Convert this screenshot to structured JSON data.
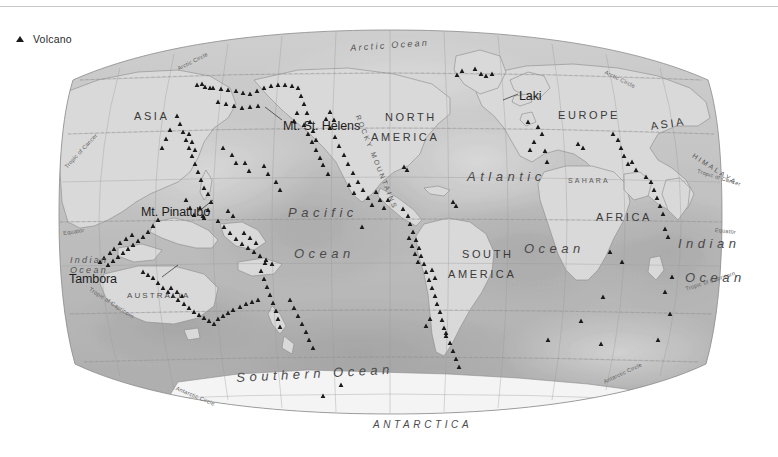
{
  "legend": {
    "icon": "volcano-triangle-icon",
    "label": "Volcano",
    "marker_color": "#1a1a1a"
  },
  "map": {
    "projection": "robinson",
    "title": "",
    "oceans": [
      {
        "name": "arctic-ocean",
        "text": "Arctic Ocean",
        "x": 292,
        "y": 22,
        "rot": -4,
        "style": "ocean-sm"
      },
      {
        "name": "pacific-ocean-1",
        "text": "Pacific",
        "x": 230,
        "y": 184,
        "rot": 0,
        "style": "ocean"
      },
      {
        "name": "pacific-ocean-2",
        "text": "Ocean",
        "x": 236,
        "y": 225,
        "rot": 0,
        "style": "ocean"
      },
      {
        "name": "atlantic-ocean-1",
        "text": "Atlantic",
        "x": 409,
        "y": 148,
        "rot": 0,
        "style": "ocean"
      },
      {
        "name": "atlantic-ocean-2",
        "text": "Ocean",
        "x": 466,
        "y": 220,
        "rot": 0,
        "style": "ocean"
      },
      {
        "name": "indian-ocean-right-1",
        "text": "Indian",
        "x": 620,
        "y": 215,
        "rot": 0,
        "style": "ocean"
      },
      {
        "name": "indian-ocean-right-2",
        "text": "Ocean",
        "x": 627,
        "y": 249,
        "rot": 0,
        "style": "ocean"
      },
      {
        "name": "indian-ocean-left",
        "text": "Indian",
        "x": 12,
        "y": 234,
        "rot": 0,
        "style": "ocean-sm"
      },
      {
        "name": "indian-ocean-left-2",
        "text": "Ocean",
        "x": 12,
        "y": 244,
        "rot": 0,
        "style": "ocean-sm"
      },
      {
        "name": "southern-ocean",
        "text": "Southern Ocean",
        "x": 178,
        "y": 349,
        "rot": -3,
        "style": "ocean"
      }
    ],
    "continents": [
      {
        "name": "asia-left",
        "text": "ASIA",
        "x": 76,
        "y": 89,
        "rot": 0,
        "style": "continent"
      },
      {
        "name": "asia-right",
        "text": "ASIA",
        "x": 592,
        "y": 99,
        "rot": -8,
        "style": "continent"
      },
      {
        "name": "north-america-1",
        "text": "NORTH",
        "x": 327,
        "y": 90,
        "rot": 0,
        "style": "continent"
      },
      {
        "name": "north-america-2",
        "text": "AMERICA",
        "x": 313,
        "y": 110,
        "rot": 0,
        "style": "continent"
      },
      {
        "name": "south-america-1",
        "text": "SOUTH",
        "x": 404,
        "y": 227,
        "rot": 0,
        "style": "continent"
      },
      {
        "name": "south-america-2",
        "text": "AMERICA",
        "x": 390,
        "y": 247,
        "rot": 0,
        "style": "continent"
      },
      {
        "name": "europe",
        "text": "EUROPE",
        "x": 500,
        "y": 88,
        "rot": 0,
        "style": "continent"
      },
      {
        "name": "africa",
        "text": "AFRICA",
        "x": 538,
        "y": 190,
        "rot": 0,
        "style": "continent"
      },
      {
        "name": "australia",
        "text": "AUSTRALIA",
        "x": 69,
        "y": 270,
        "rot": 0,
        "style": "continent-sm"
      },
      {
        "name": "antarctica",
        "text": "ANTARCTICA",
        "x": 315,
        "y": 398,
        "rot": 0,
        "style": "antarctica"
      }
    ],
    "regions": [
      {
        "name": "sahara",
        "text": "SAHARA",
        "x": 510,
        "y": 155,
        "rot": 0,
        "style": "region"
      },
      {
        "name": "himalaya",
        "text": "HIMALAYA",
        "x": 637,
        "y": 130,
        "rot": 33,
        "style": "region"
      },
      {
        "name": "rocky-mountains",
        "text": "ROCKY MOUNTAINS",
        "x": 303,
        "y": 92,
        "rot": 68,
        "style": "region"
      }
    ],
    "latitude_lines": [
      {
        "name": "arctic-circle-left",
        "text": "Arctic Circle",
        "x": 119,
        "y": 45,
        "rot": -27
      },
      {
        "name": "arctic-circle-right",
        "text": "Arctic Circle",
        "x": 548,
        "y": 48,
        "rot": 26
      },
      {
        "name": "tropic-of-cancer-left",
        "text": "Tropic of Cancer",
        "x": 6,
        "y": 144,
        "rot": -47
      },
      {
        "name": "tropic-of-cancer-right",
        "text": "Tropic of Cancer",
        "x": 640,
        "y": 147,
        "rot": 17
      },
      {
        "name": "equator-left",
        "text": "Equator",
        "x": 5,
        "y": 209,
        "rot": -8
      },
      {
        "name": "equator-right",
        "text": "Equator",
        "x": 657,
        "y": 206,
        "rot": 5
      },
      {
        "name": "tropic-of-capricorn-left",
        "text": "Tropic of Capricorn",
        "x": 33,
        "y": 265,
        "rot": 33
      },
      {
        "name": "tropic-of-capricorn-right",
        "text": "Tropic of Capricorn",
        "x": 627,
        "y": 265,
        "rot": -18
      },
      {
        "name": "antarctic-circle-left",
        "text": "Antarctic Circle",
        "x": 119,
        "y": 364,
        "rot": 23
      },
      {
        "name": "antarctic-circle-right",
        "text": "Antarctic Circle",
        "x": 545,
        "y": 358,
        "rot": -25
      }
    ],
    "volcano_labels": [
      {
        "name": "mt-st-helens",
        "text": "Mt. St. Helens",
        "x": 225,
        "y": 98,
        "leader": [
          224,
          98,
          207,
          85
        ]
      },
      {
        "name": "laki",
        "text": "Laki",
        "x": 461,
        "y": 68,
        "leader": [
          460,
          72,
          445,
          78
        ]
      },
      {
        "name": "mt-pinatubo",
        "text": "Mt. Pinatubo",
        "x": 83,
        "y": 184,
        "leader": [
          140,
          190,
          155,
          178
        ]
      },
      {
        "name": "tambora",
        "text": "Tambora",
        "x": 11,
        "y": 251,
        "leader": [
          104,
          255,
          120,
          243
        ]
      }
    ],
    "volcano_points": [
      [
        139,
        63
      ],
      [
        147,
        65
      ],
      [
        155,
        66
      ],
      [
        163,
        67
      ],
      [
        170,
        68
      ],
      [
        178,
        69
      ],
      [
        185,
        71
      ],
      [
        192,
        72
      ],
      [
        199,
        69
      ],
      [
        206,
        66
      ],
      [
        213,
        64
      ],
      [
        220,
        63
      ],
      [
        227,
        63
      ],
      [
        234,
        64
      ],
      [
        240,
        66
      ],
      [
        160,
        80
      ],
      [
        168,
        82
      ],
      [
        176,
        84
      ],
      [
        184,
        86
      ],
      [
        192,
        85
      ],
      [
        200,
        84
      ],
      [
        243,
        74
      ],
      [
        246,
        82
      ],
      [
        249,
        91
      ],
      [
        252,
        100
      ],
      [
        255,
        109
      ],
      [
        258,
        118
      ],
      [
        246,
        103
      ],
      [
        250,
        112
      ],
      [
        254,
        120
      ],
      [
        258,
        128
      ],
      [
        262,
        136
      ],
      [
        239,
        91
      ],
      [
        236,
        99
      ],
      [
        268,
        97
      ],
      [
        272,
        106
      ],
      [
        277,
        115
      ],
      [
        281,
        124
      ],
      [
        286,
        133
      ],
      [
        290,
        142
      ],
      [
        295,
        151
      ],
      [
        300,
        160
      ],
      [
        305,
        168
      ],
      [
        310,
        176
      ],
      [
        314,
        183
      ],
      [
        318,
        170
      ],
      [
        322,
        178
      ],
      [
        326,
        186
      ],
      [
        330,
        178
      ],
      [
        291,
        163
      ],
      [
        296,
        171
      ],
      [
        265,
        143
      ],
      [
        270,
        152
      ],
      [
        345,
        187
      ],
      [
        350,
        194
      ],
      [
        352,
        202
      ],
      [
        355,
        210
      ],
      [
        358,
        218
      ],
      [
        361,
        226
      ],
      [
        351,
        216
      ],
      [
        354,
        224
      ],
      [
        357,
        232
      ],
      [
        360,
        240
      ],
      [
        363,
        234
      ],
      [
        366,
        242
      ],
      [
        368,
        250
      ],
      [
        371,
        258
      ],
      [
        374,
        266
      ],
      [
        377,
        274
      ],
      [
        379,
        282
      ],
      [
        382,
        290
      ],
      [
        384,
        298
      ],
      [
        386,
        306
      ],
      [
        388,
        314
      ],
      [
        374,
        248
      ],
      [
        377,
        256
      ],
      [
        119,
        94
      ],
      [
        122,
        102
      ],
      [
        125,
        110
      ],
      [
        128,
        118
      ],
      [
        131,
        126
      ],
      [
        134,
        134
      ],
      [
        137,
        142
      ],
      [
        140,
        150
      ],
      [
        143,
        158
      ],
      [
        146,
        166
      ],
      [
        131,
        112
      ],
      [
        134,
        120
      ],
      [
        137,
        128
      ],
      [
        112,
        108
      ],
      [
        108,
        117
      ],
      [
        104,
        126
      ],
      [
        150,
        172
      ],
      [
        153,
        180
      ],
      [
        150,
        188
      ],
      [
        146,
        196
      ],
      [
        142,
        186
      ],
      [
        145,
        194
      ],
      [
        128,
        178
      ],
      [
        132,
        186
      ],
      [
        136,
        193
      ],
      [
        100,
        198
      ],
      [
        95,
        204
      ],
      [
        90,
        210
      ],
      [
        85,
        215
      ],
      [
        80,
        219
      ],
      [
        75,
        223
      ],
      [
        70,
        227
      ],
      [
        65,
        231
      ],
      [
        60,
        235
      ],
      [
        55,
        239
      ],
      [
        50,
        243
      ],
      [
        62,
        221
      ],
      [
        68,
        217
      ],
      [
        74,
        213
      ],
      [
        160,
        199
      ],
      [
        166,
        205
      ],
      [
        172,
        211
      ],
      [
        178,
        217
      ],
      [
        184,
        222
      ],
      [
        190,
        226
      ],
      [
        196,
        230
      ],
      [
        202,
        234
      ],
      [
        208,
        238
      ],
      [
        214,
        242
      ],
      [
        186,
        211
      ],
      [
        192,
        216
      ],
      [
        198,
        221
      ],
      [
        170,
        189
      ],
      [
        175,
        194
      ],
      [
        203,
        249
      ],
      [
        206,
        257
      ],
      [
        209,
        265
      ],
      [
        212,
        273
      ],
      [
        215,
        281
      ],
      [
        218,
        289
      ],
      [
        220,
        297
      ],
      [
        222,
        305
      ],
      [
        207,
        241
      ],
      [
        152,
        66
      ],
      [
        144,
        62
      ],
      [
        423,
        52
      ],
      [
        428,
        54
      ],
      [
        434,
        52
      ],
      [
        417,
        47
      ],
      [
        399,
        53
      ],
      [
        404,
        49
      ],
      [
        476,
        120
      ],
      [
        472,
        128
      ],
      [
        480,
        105
      ],
      [
        484,
        112
      ],
      [
        470,
        100
      ],
      [
        487,
        129
      ],
      [
        489,
        140
      ],
      [
        520,
        122
      ],
      [
        525,
        126
      ],
      [
        555,
        112
      ],
      [
        560,
        118
      ],
      [
        563,
        126
      ],
      [
        566,
        134
      ],
      [
        570,
        142
      ],
      [
        574,
        140
      ],
      [
        578,
        148
      ],
      [
        593,
        160
      ],
      [
        596,
        168
      ],
      [
        599,
        176
      ],
      [
        602,
        184
      ],
      [
        605,
        192
      ],
      [
        588,
        155
      ],
      [
        607,
        207
      ],
      [
        610,
        215
      ],
      [
        552,
        230
      ],
      [
        564,
        240
      ],
      [
        545,
        275
      ],
      [
        614,
        255
      ],
      [
        607,
        270
      ],
      [
        346,
        145
      ],
      [
        349,
        148
      ],
      [
        395,
        180
      ],
      [
        398,
        184
      ],
      [
        304,
        205
      ],
      [
        372,
        297
      ],
      [
        368,
        304
      ],
      [
        392,
        321
      ],
      [
        395,
        329
      ],
      [
        398,
        337
      ],
      [
        401,
        345
      ],
      [
        388,
        311
      ],
      [
        543,
        322
      ],
      [
        600,
        318
      ],
      [
        283,
        363
      ],
      [
        265,
        374
      ],
      [
        490,
        318
      ],
      [
        523,
        299
      ],
      [
        612,
        292
      ],
      [
        236,
        286
      ],
      [
        240,
        294
      ],
      [
        244,
        302
      ],
      [
        248,
        310
      ],
      [
        251,
        318
      ],
      [
        255,
        326
      ],
      [
        232,
        278
      ],
      [
        218,
        160
      ],
      [
        222,
        168
      ],
      [
        206,
        144
      ],
      [
        210,
        152
      ],
      [
        187,
        141
      ],
      [
        191,
        149
      ],
      [
        174,
        133
      ],
      [
        178,
        141
      ],
      [
        165,
        126
      ],
      [
        95,
        256
      ],
      [
        100,
        261
      ],
      [
        105,
        266
      ],
      [
        110,
        270
      ],
      [
        115,
        274
      ],
      [
        120,
        278
      ],
      [
        126,
        282
      ],
      [
        131,
        286
      ],
      [
        136,
        290
      ],
      [
        141,
        293
      ],
      [
        146,
        296
      ],
      [
        151,
        299
      ],
      [
        156,
        302
      ],
      [
        113,
        266
      ],
      [
        119,
        270
      ],
      [
        124,
        274
      ],
      [
        85,
        250
      ],
      [
        90,
        253
      ],
      [
        160,
        297
      ],
      [
        165,
        294
      ],
      [
        170,
        291
      ],
      [
        175,
        288
      ],
      [
        182,
        285
      ],
      [
        188,
        282
      ],
      [
        194,
        280
      ],
      [
        200,
        278
      ],
      [
        56,
        227
      ],
      [
        52,
        231
      ],
      [
        46,
        236
      ],
      [
        42,
        240
      ],
      [
        272,
        90
      ],
      [
        276,
        98
      ]
    ]
  }
}
